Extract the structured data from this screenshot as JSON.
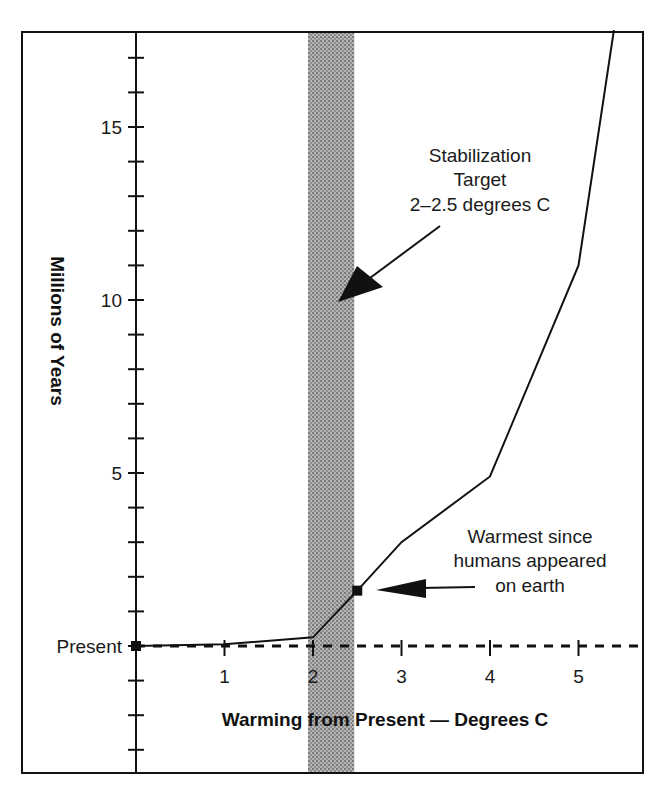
{
  "chart_data": {
    "type": "line",
    "title": "",
    "xlabel": "Warming from Present — Degrees C",
    "ylabel": "Millions of Years",
    "x_ticks": [
      "1",
      "2",
      "3",
      "4",
      "5"
    ],
    "y_ticks": [
      "Present",
      "5",
      "10",
      "15"
    ],
    "xlim": [
      0,
      5.6
    ],
    "ylim": [
      -3.7,
      17.8
    ],
    "grid": false,
    "legend": null,
    "series": [
      {
        "name": "Millions of years since Earth was this warm",
        "x": [
          0,
          1,
          2,
          2.5,
          3,
          4,
          5,
          5.4
        ],
        "y": [
          0,
          0.05,
          0.25,
          1.6,
          3.0,
          4.9,
          11.0,
          17.8
        ]
      }
    ],
    "markers": [
      {
        "x": 0,
        "y": 0,
        "label": "Present"
      },
      {
        "x": 2.5,
        "y": 1.6,
        "label": "Warmest since humans appeared on earth"
      }
    ],
    "reference_line": {
      "y": 0,
      "style": "dashed",
      "label": "Present"
    },
    "shaded_band": {
      "x_from": 2,
      "x_to": 2.5,
      "label": "Stabilization Target 2–2.5 degrees C"
    },
    "annotations": [
      {
        "lines": [
          "Stabilization",
          "Target",
          "2–2.5 degrees C"
        ],
        "points_to": "shaded_band"
      },
      {
        "lines": [
          "Warmest since",
          "humans appeared",
          "on earth"
        ],
        "points_to": "marker_2.5"
      }
    ]
  },
  "colors": {
    "line": "#111111",
    "band": "#8a8a8a",
    "background": "#ffffff"
  }
}
